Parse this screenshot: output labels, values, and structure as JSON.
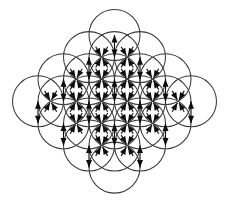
{
  "figure": {
    "type": "geometric-diagram",
    "background_color": "#ffffff",
    "circle_stroke_color": "#3a3a3a",
    "arrow_color": "#0d0d0d",
    "circle_stroke_width": 1.05,
    "canvas": {
      "width": 229,
      "height": 205
    }
  },
  "lattice": {
    "arrangement": "hexagonal",
    "circle_count": 19,
    "circle_radius": 25.5,
    "row_spacing": 22.1,
    "column_spacing": 25.5,
    "rows": [
      {
        "index": 0,
        "count": 3,
        "y": 39.0,
        "x_start": 88.5
      },
      {
        "index": 1,
        "count": 4,
        "y": 61.1,
        "x_start": 76.0
      },
      {
        "index": 2,
        "count": 5,
        "y": 83.2,
        "x_start": 63.5
      },
      {
        "index": 3,
        "count": 4,
        "y": 105.3,
        "x_start": 76.0
      },
      {
        "index": 4,
        "count": 3,
        "y": 127.4,
        "x_start": 88.5
      }
    ],
    "circle_centers": [
      [
        114.5,
        35.0
      ],
      [
        89.0,
        57.1
      ],
      [
        114.5,
        57.1
      ],
      [
        140.0,
        57.1
      ],
      [
        63.5,
        79.2
      ],
      [
        89.0,
        79.2
      ],
      [
        114.5,
        79.2
      ],
      [
        140.0,
        79.2
      ],
      [
        165.5,
        79.2
      ],
      [
        38.0,
        101.3
      ],
      [
        63.5,
        101.3
      ],
      [
        89.0,
        101.3
      ],
      [
        114.5,
        101.3
      ],
      [
        140.0,
        101.3
      ],
      [
        165.5,
        101.3
      ],
      [
        191.0,
        101.3
      ],
      [
        63.5,
        123.4
      ],
      [
        89.0,
        123.4
      ],
      [
        114.5,
        123.4
      ],
      [
        140.0,
        123.4
      ],
      [
        165.5,
        123.4
      ],
      [
        89.0,
        145.5
      ],
      [
        114.5,
        145.5
      ],
      [
        140.0,
        145.5
      ],
      [
        114.5,
        167.6
      ]
    ]
  },
  "arrows": {
    "style": "double-headed",
    "head_length": 7.5,
    "head_half_width": 3.0,
    "shaft_width": 1.15,
    "description": "Pairs of opposing arrowheads meeting at circle intersection nodes",
    "vertical_nodes": [
      [
        114.5,
        46.0
      ],
      [
        89.0,
        68.2
      ],
      [
        140.0,
        68.2
      ],
      [
        63.5,
        90.2
      ],
      [
        114.5,
        90.2
      ],
      [
        165.5,
        90.2
      ],
      [
        38.0,
        112.3
      ],
      [
        89.0,
        112.3
      ],
      [
        140.0,
        112.3
      ],
      [
        191.0,
        112.3
      ],
      [
        63.5,
        134.4
      ],
      [
        114.5,
        134.4
      ],
      [
        165.5,
        134.4
      ],
      [
        89.0,
        156.5
      ],
      [
        140.0,
        156.5
      ]
    ],
    "converge_nodes": [
      [
        101.7,
        57.1
      ],
      [
        127.2,
        57.1
      ],
      [
        76.2,
        79.2
      ],
      [
        101.7,
        79.2
      ],
      [
        127.2,
        79.2
      ],
      [
        152.7,
        79.2
      ],
      [
        50.7,
        101.3
      ],
      [
        76.2,
        101.3
      ],
      [
        101.7,
        101.3
      ],
      [
        127.2,
        101.3
      ],
      [
        152.7,
        101.3
      ],
      [
        178.2,
        101.3
      ],
      [
        76.2,
        123.4
      ],
      [
        101.7,
        123.4
      ],
      [
        127.2,
        123.4
      ],
      [
        152.7,
        123.4
      ],
      [
        101.7,
        145.5
      ],
      [
        127.2,
        145.5
      ]
    ],
    "converge_directions_deg": [
      60,
      120,
      240,
      300
    ],
    "vertical_directions_deg": [
      90,
      270
    ]
  }
}
